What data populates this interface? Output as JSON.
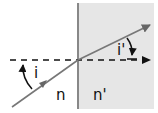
{
  "diagram": {
    "type": "refraction",
    "labels": {
      "incident_angle": "i",
      "refracted_angle": "i'",
      "medium_left": "n",
      "medium_right": "n'"
    },
    "colors": {
      "background": "#ffffff",
      "medium_right_fill": "#e6e6e6",
      "interface_line": "#888888",
      "ray": "#777777",
      "normal": "#111111",
      "text": "#111111"
    }
  }
}
